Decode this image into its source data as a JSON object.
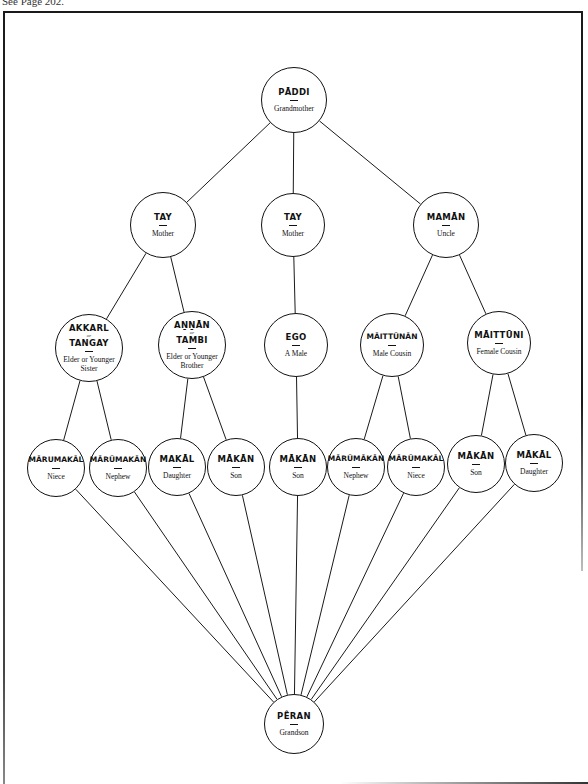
{
  "header_note": "See Page 202.",
  "diagram": {
    "line_color": "#1a1a1a",
    "nodes": [
      {
        "id": "paddi",
        "term": "PĀDDI",
        "gloss": "Grandmother",
        "cx": 294,
        "cy": 100,
        "r": 33
      },
      {
        "id": "tay-left",
        "term": "TAY",
        "gloss": "Mother",
        "cx": 163,
        "cy": 225,
        "r": 33
      },
      {
        "id": "tay-center",
        "term": "TAY",
        "gloss": "Mother",
        "cx": 293,
        "cy": 225,
        "r": 32
      },
      {
        "id": "maman",
        "term": "MAMĀN",
        "gloss": "Uncle",
        "cx": 446,
        "cy": 225,
        "r": 33
      },
      {
        "id": "akkarl",
        "term": "AKKARL",
        "term_or": "or",
        "term2": "TANGAY",
        "gloss": "Elder or Younger",
        "gloss2": "Sister",
        "cx": 89,
        "cy": 348,
        "r": 34
      },
      {
        "id": "annan",
        "term": "AṈṈĀN",
        "term_or": "or",
        "term2": "TAMBI",
        "gloss": "Elder or Younger",
        "gloss2": "Brother",
        "cx": 192,
        "cy": 345,
        "r": 34
      },
      {
        "id": "ego",
        "term": "EGO",
        "gloss": "A Male",
        "cx": 296,
        "cy": 345,
        "r": 32
      },
      {
        "id": "maittunan",
        "term": "MĀITTŪNĀN",
        "gloss": "Male Cousin",
        "cx": 392,
        "cy": 345,
        "r": 32
      },
      {
        "id": "maittuni",
        "term": "MĀITTŪNI",
        "gloss": "Female Cousin",
        "cx": 499,
        "cy": 343,
        "r": 32
      },
      {
        "id": "marumakal-1",
        "term": "MĀRUMAKĀL",
        "gloss": "Niece",
        "cx": 56,
        "cy": 468,
        "r": 29
      },
      {
        "id": "marumakan-1",
        "term": "MĀRŪMAKĀN",
        "gloss": "Nephew",
        "cx": 118,
        "cy": 468,
        "r": 29
      },
      {
        "id": "makal-1",
        "term": "MAKĀL",
        "gloss": "Daughter",
        "cx": 177,
        "cy": 467,
        "r": 29
      },
      {
        "id": "makan-1",
        "term": "MĀKĀN",
        "gloss": "Son",
        "cx": 236,
        "cy": 467,
        "r": 29
      },
      {
        "id": "makan-2",
        "term": "MĀKĀN",
        "gloss": "Son",
        "cx": 298,
        "cy": 467,
        "r": 29
      },
      {
        "id": "marumakan-2",
        "term": "MĀRŪMĀKĀN",
        "gloss": "Nephew",
        "cx": 356,
        "cy": 467,
        "r": 29
      },
      {
        "id": "marumakal-2",
        "term": "MĀRŪMAKĀL",
        "gloss": "Niece",
        "cx": 416,
        "cy": 467,
        "r": 29
      },
      {
        "id": "makan-3",
        "term": "MĀKĀN",
        "gloss": "Son",
        "cx": 476,
        "cy": 464,
        "r": 29
      },
      {
        "id": "makal-2",
        "term": "MĀKĀL",
        "gloss": "Daughter",
        "cx": 534,
        "cy": 463,
        "r": 29
      },
      {
        "id": "peran",
        "term": "PÊRAN",
        "gloss": "Grandson",
        "cx": 294,
        "cy": 724,
        "r": 30
      }
    ],
    "edges": [
      [
        "paddi",
        "tay-left"
      ],
      [
        "paddi",
        "tay-center"
      ],
      [
        "paddi",
        "maman"
      ],
      [
        "tay-left",
        "akkarl"
      ],
      [
        "tay-left",
        "annan"
      ],
      [
        "tay-center",
        "ego"
      ],
      [
        "maman",
        "maittunan"
      ],
      [
        "maman",
        "maittuni"
      ],
      [
        "akkarl",
        "marumakal-1"
      ],
      [
        "akkarl",
        "marumakan-1"
      ],
      [
        "annan",
        "makal-1"
      ],
      [
        "annan",
        "makan-1"
      ],
      [
        "ego",
        "makan-2"
      ],
      [
        "maittunan",
        "marumakan-2"
      ],
      [
        "maittunan",
        "marumakal-2"
      ],
      [
        "maittuni",
        "makan-3"
      ],
      [
        "maittuni",
        "makal-2"
      ],
      [
        "marumakal-1",
        "peran"
      ],
      [
        "marumakan-1",
        "peran"
      ],
      [
        "makal-1",
        "peran"
      ],
      [
        "makan-1",
        "peran"
      ],
      [
        "makan-2",
        "peran"
      ],
      [
        "marumakan-2",
        "peran"
      ],
      [
        "marumakal-2",
        "peran"
      ],
      [
        "makan-3",
        "peran"
      ],
      [
        "makal-2",
        "peran"
      ]
    ]
  }
}
